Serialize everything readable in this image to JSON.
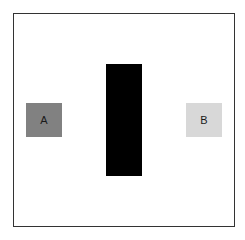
{
  "diagram": {
    "box_a": {
      "label": "A",
      "color": "#818181"
    },
    "box_b": {
      "label": "B",
      "color": "#d8d8d8"
    },
    "barrier": {
      "color": "#000000"
    },
    "frame_color": "#333333"
  }
}
